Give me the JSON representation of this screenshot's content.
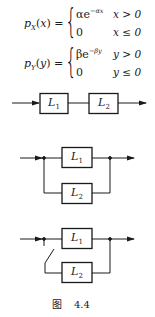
{
  "equations": [
    {
      "lhs_func": "p",
      "lhs_sub": "X",
      "lhs_arg": "x",
      "cases": [
        {
          "expr_base": "αe",
          "expr_exp": "−αx",
          "cond": "x > 0"
        },
        {
          "expr_base": "0",
          "expr_exp": "",
          "cond": "x ≤ 0"
        }
      ]
    },
    {
      "lhs_func": "p",
      "lhs_sub": "Y",
      "lhs_arg": "y",
      "cases": [
        {
          "expr_base": "βe",
          "expr_exp": "−βy",
          "cond": "y > 0"
        },
        {
          "expr_base": "0",
          "expr_exp": "",
          "cond": "y ≤ 0"
        }
      ]
    }
  ],
  "diagrams": {
    "series": {
      "blocks": [
        {
          "name": "L",
          "sub": "1"
        },
        {
          "name": "L",
          "sub": "2"
        }
      ]
    },
    "parallel": {
      "blocks": [
        {
          "name": "L",
          "sub": "1"
        },
        {
          "name": "L",
          "sub": "2"
        }
      ]
    },
    "standby": {
      "blocks": [
        {
          "name": "L",
          "sub": "1"
        },
        {
          "name": "L",
          "sub": "2"
        }
      ],
      "has_switch": true
    }
  },
  "caption": {
    "prefix": "图",
    "number": "4.4"
  },
  "colors": {
    "line": "#1a1a1a",
    "background": "#ffffff"
  }
}
